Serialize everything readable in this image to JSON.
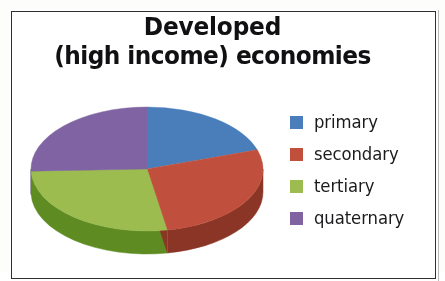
{
  "figure": {
    "title_line1": "Developed",
    "title_line2": "(high income) economies",
    "background_color": "#ffffff",
    "border_color": "#2f3033"
  },
  "legend": {
    "position": "right",
    "items": [
      {
        "label": "primary",
        "color": "#4a7ebb",
        "swatch_name": "legend-swatch-primary"
      },
      {
        "label": "secondary",
        "color": "#c0503c",
        "swatch_name": "legend-swatch-secondary"
      },
      {
        "label": "tertiary",
        "color": "#9cbc50",
        "swatch_name": "legend-swatch-tertiary"
      },
      {
        "label": "quaternary",
        "color": "#8064a2",
        "swatch_name": "legend-swatch-quaternary"
      }
    ]
  },
  "chart_data": {
    "type": "pie",
    "title": "Developed (high income) economies",
    "subtitle": "",
    "xlabel": "",
    "ylabel": "",
    "three_d": true,
    "start_angle_deg": 0,
    "direction": "clockwise",
    "legend_position": "right",
    "grid": false,
    "categories": [
      "primary",
      "secondary",
      "tertiary",
      "quaternary"
    ],
    "values": [
      20,
      27,
      27,
      26
    ],
    "units": "percent",
    "colors": [
      "#4a7ebb",
      "#c0503c",
      "#9cbc50",
      "#8064a2"
    ],
    "side_colors": [
      "#31588a",
      "#8b3526",
      "#5e8c23",
      "#584071"
    ],
    "slices": [
      {
        "name": "primary",
        "value": 20,
        "color": "#4a7ebb",
        "start_deg": 0,
        "end_deg": 72
      },
      {
        "name": "secondary",
        "value": 27,
        "color": "#c0503c",
        "start_deg": 72,
        "end_deg": 170
      },
      {
        "name": "tertiary",
        "value": 27,
        "color": "#9cbc50",
        "start_deg": 170,
        "end_deg": 268
      },
      {
        "name": "quaternary",
        "value": 26,
        "color": "#8064a2",
        "start_deg": 268,
        "end_deg": 360
      }
    ]
  }
}
